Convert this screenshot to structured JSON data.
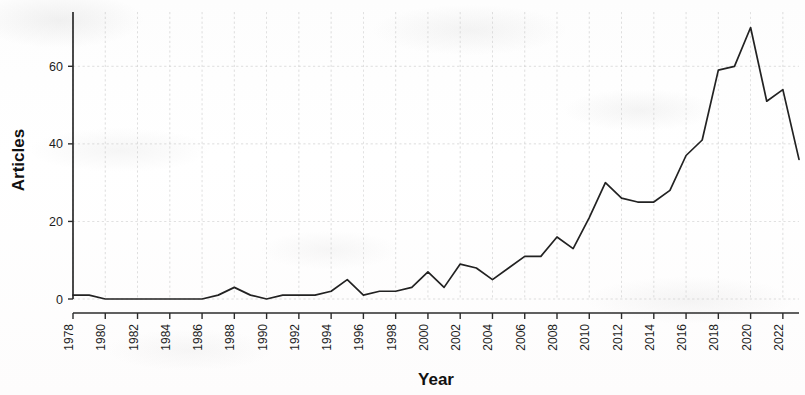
{
  "chart_data": {
    "type": "line",
    "title": "",
    "xlabel": "Year",
    "ylabel": "Articles",
    "xlim": [
      1978,
      2023
    ],
    "ylim": [
      0,
      74
    ],
    "grid": true,
    "legend": null,
    "x_tick_labels": [
      "1978",
      "1980",
      "1982",
      "1984",
      "1986",
      "1988",
      "1990",
      "1992",
      "1994",
      "1996",
      "1998",
      "2000",
      "2002",
      "2004",
      "2006",
      "2008",
      "2010",
      "2012",
      "2014",
      "2016",
      "2018",
      "2020",
      "2022"
    ],
    "y_tick_labels": [
      "0",
      "20",
      "40",
      "60"
    ],
    "y_ticks": [
      0,
      20,
      40,
      60
    ],
    "line_color": "#222222",
    "grid_color": "#cfcfcf",
    "x": [
      1978,
      1979,
      1980,
      1981,
      1982,
      1983,
      1984,
      1985,
      1986,
      1987,
      1988,
      1989,
      1990,
      1991,
      1992,
      1993,
      1994,
      1995,
      1996,
      1997,
      1998,
      1999,
      2000,
      2001,
      2002,
      2003,
      2004,
      2005,
      2006,
      2007,
      2008,
      2009,
      2010,
      2011,
      2012,
      2013,
      2014,
      2015,
      2016,
      2017,
      2018,
      2019,
      2020,
      2021,
      2022,
      2023
    ],
    "values": [
      1,
      1,
      0,
      0,
      0,
      0,
      0,
      0,
      0,
      1,
      3,
      1,
      0,
      1,
      1,
      1,
      2,
      5,
      1,
      2,
      2,
      3,
      7,
      3,
      9,
      8,
      5,
      8,
      11,
      11,
      16,
      13,
      21,
      30,
      26,
      25,
      25,
      28,
      37,
      41,
      59,
      60,
      70,
      51,
      54,
      36
    ],
    "series": [
      {
        "name": "Articles",
        "values": [
          1,
          1,
          0,
          0,
          0,
          0,
          0,
          0,
          0,
          1,
          3,
          1,
          0,
          1,
          1,
          1,
          2,
          5,
          1,
          2,
          2,
          3,
          7,
          3,
          9,
          8,
          5,
          8,
          11,
          11,
          16,
          13,
          21,
          30,
          26,
          25,
          25,
          28,
          37,
          41,
          59,
          60,
          70,
          51,
          54,
          36
        ]
      }
    ]
  },
  "axes": {
    "y_title": "Articles",
    "x_title": "Year"
  }
}
